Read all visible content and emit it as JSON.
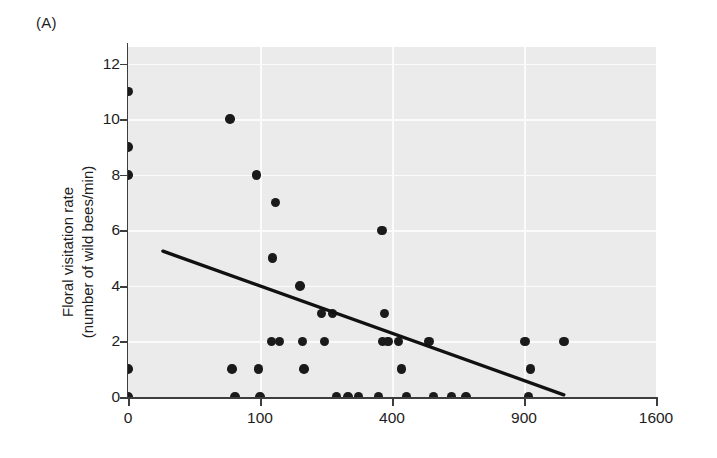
{
  "panel": {
    "label": "(A)"
  },
  "axes": {
    "ylabel_line1": "Floral visitation rate",
    "ylabel_line2": "(number of wild bees/min)",
    "xlabel": ""
  },
  "chart_data": {
    "type": "scatter",
    "title": "",
    "xlabel": "",
    "ylabel": "Floral visitation rate (number of wild bees/min)",
    "panel_label": "(A)",
    "x_scale": "sqrt",
    "xlim": [
      0,
      1600
    ],
    "ylim": [
      0,
      12.6
    ],
    "xticks": [
      0,
      100,
      400,
      900,
      1600
    ],
    "xticklabels": [
      "0",
      "100",
      "400",
      "900",
      "1600"
    ],
    "yticks": [
      0,
      2,
      4,
      6,
      8,
      10,
      12
    ],
    "yticklabels": [
      "0",
      "2",
      "4",
      "6",
      "8",
      "10",
      "12"
    ],
    "grid": true,
    "grid_color": "#fbfbfb",
    "panel_background": "#ebebeb",
    "marker_color": "#1a1a1a",
    "legend": "none",
    "points": [
      {
        "x": 0,
        "y": 11
      },
      {
        "x": 0,
        "y": 9
      },
      {
        "x": 0,
        "y": 8
      },
      {
        "x": 0,
        "y": 1
      },
      {
        "x": 0,
        "y": 0
      },
      {
        "x": 60,
        "y": 10
      },
      {
        "x": 62,
        "y": 1
      },
      {
        "x": 66,
        "y": 0
      },
      {
        "x": 95,
        "y": 8
      },
      {
        "x": 98,
        "y": 1
      },
      {
        "x": 100,
        "y": 0
      },
      {
        "x": 125,
        "y": 7
      },
      {
        "x": 120,
        "y": 5
      },
      {
        "x": 118,
        "y": 2
      },
      {
        "x": 132,
        "y": 2
      },
      {
        "x": 170,
        "y": 4
      },
      {
        "x": 175,
        "y": 2
      },
      {
        "x": 178,
        "y": 1
      },
      {
        "x": 215,
        "y": 3
      },
      {
        "x": 222,
        "y": 2
      },
      {
        "x": 240,
        "y": 3
      },
      {
        "x": 250,
        "y": 0
      },
      {
        "x": 278,
        "y": 0
      },
      {
        "x": 305,
        "y": 0
      },
      {
        "x": 370,
        "y": 6
      },
      {
        "x": 378,
        "y": 3
      },
      {
        "x": 372,
        "y": 2
      },
      {
        "x": 388,
        "y": 2
      },
      {
        "x": 360,
        "y": 0
      },
      {
        "x": 420,
        "y": 2
      },
      {
        "x": 430,
        "y": 1
      },
      {
        "x": 445,
        "y": 0
      },
      {
        "x": 520,
        "y": 2
      },
      {
        "x": 535,
        "y": 0
      },
      {
        "x": 600,
        "y": 0
      },
      {
        "x": 655,
        "y": 0
      },
      {
        "x": 905,
        "y": 2
      },
      {
        "x": 930,
        "y": 1
      },
      {
        "x": 920,
        "y": 0
      },
      {
        "x": 1090,
        "y": 2
      }
    ],
    "trend_line": {
      "type": "linear-fit",
      "color": "#111111",
      "x_start": 7,
      "y_start": 5.25,
      "x_end": 1090,
      "y_end": 0.08
    }
  }
}
